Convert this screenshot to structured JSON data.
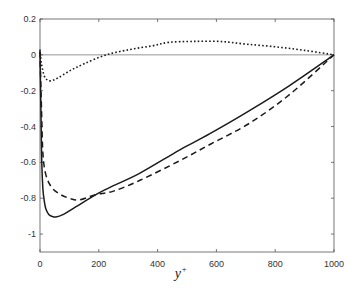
{
  "chart_data": {
    "type": "line",
    "title": "",
    "xlabel": "y+",
    "xlabel_base": "y",
    "xlabel_sup": "+",
    "ylabel": "",
    "xlim": [
      0,
      1000
    ],
    "ylim": [
      -1.1,
      0.2
    ],
    "grid": false,
    "legend": null,
    "x_ticks": [
      0,
      200,
      400,
      600,
      800,
      1000
    ],
    "x_tick_labels": [
      "0",
      "200",
      "400",
      "600",
      "800",
      "1000"
    ],
    "y_ticks": [
      0.2,
      0,
      -0.2,
      -0.4,
      -0.6,
      -0.8,
      -1
    ],
    "y_tick_labels": [
      "0.2",
      "0",
      "-0.2",
      "-0.4",
      "-0.6",
      "-0.8",
      "-1"
    ],
    "reference_lines": [
      {
        "axis": "y",
        "value": 0,
        "style": "thin solid"
      }
    ],
    "series": [
      {
        "name": "solid",
        "style": "solid",
        "color": "#1a1a1a",
        "x": [
          0,
          3,
          6,
          10,
          15,
          20,
          30,
          40,
          54,
          80,
          120,
          190,
          250,
          340,
          476,
          578,
          714,
          850,
          1000
        ],
        "values": [
          0.02,
          -0.3,
          -0.6,
          -0.75,
          -0.82,
          -0.86,
          -0.89,
          -0.9,
          -0.905,
          -0.89,
          -0.85,
          -0.78,
          -0.73,
          -0.66,
          -0.53,
          -0.44,
          -0.31,
          -0.17,
          0.0
        ]
      },
      {
        "name": "dashed",
        "style": "dashed",
        "color": "#1a1a1a",
        "x": [
          0,
          5,
          10,
          20,
          40,
          70,
          100,
          133,
          190,
          250,
          340,
          476,
          578,
          714,
          850,
          1000
        ],
        "values": [
          0.02,
          -0.3,
          -0.55,
          -0.67,
          -0.74,
          -0.78,
          -0.8,
          -0.81,
          -0.78,
          -0.76,
          -0.7,
          -0.59,
          -0.5,
          -0.38,
          -0.22,
          0.0
        ]
      },
      {
        "name": "dotted",
        "style": "dotted",
        "color": "#1a1a1a",
        "x": [
          0,
          5,
          15,
          25,
          37,
          60,
          100,
          150,
          225,
          306,
          380,
          440,
          520,
          610,
          700,
          800,
          900,
          1000
        ],
        "values": [
          0.03,
          -0.05,
          -0.12,
          -0.14,
          -0.145,
          -0.13,
          -0.09,
          -0.05,
          0.0,
          0.03,
          0.05,
          0.07,
          0.075,
          0.075,
          0.06,
          0.045,
          0.025,
          0.0
        ]
      }
    ]
  }
}
